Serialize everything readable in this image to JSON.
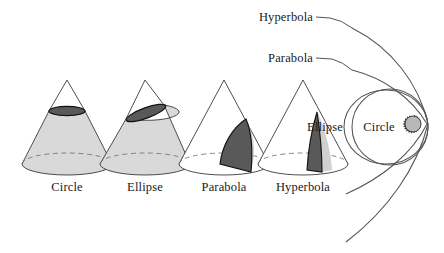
{
  "figure": {
    "width": 444,
    "height": 253,
    "background_color": "#ffffff"
  },
  "colors": {
    "stroke": "#3a3a3a",
    "cone_fill": "#d9d9d9",
    "section_dark": "#595959",
    "section_mid": "#6e6e6e",
    "sun_fill": "#b8b8b8",
    "sun_outline": "#262626",
    "text": "#1a1a1a",
    "dashed_stroke": "#6b6b6b"
  },
  "cones": [
    {
      "id": "cone-circle",
      "label": "Circle",
      "label_x": 67,
      "label_y": 188,
      "apex_x": 67,
      "apex_y": 80,
      "base_cx": 67,
      "base_cy": 164,
      "base_rx": 45,
      "base_ry": 11,
      "body_filled": true,
      "section_type": "horizontal-ellipse",
      "section_cx": 67,
      "section_cy": 111,
      "section_rx": 18,
      "section_ry": 4.6,
      "section_rotation": 0
    },
    {
      "id": "cone-ellipse",
      "label": "Ellipse",
      "label_x": 145,
      "label_y": 188,
      "apex_x": 145,
      "apex_y": 80,
      "base_cx": 145,
      "base_cy": 164,
      "base_rx": 45,
      "base_ry": 11,
      "body_filled": true,
      "section_type": "tilted-ellipse",
      "section_cx": 146,
      "section_cy": 113,
      "section_rx": 21,
      "section_ry": 5.2,
      "section_rotation": -20
    },
    {
      "id": "cone-parabola",
      "label": "Parabola",
      "label_x": 224,
      "label_y": 188,
      "apex_x": 224,
      "apex_y": 80,
      "base_cx": 224,
      "base_cy": 164,
      "base_rx": 45,
      "base_ry": 11,
      "body_filled": false,
      "section_type": "parabolic-slice"
    },
    {
      "id": "cone-hyperbola",
      "label": "Hyperbola",
      "label_x": 303,
      "label_y": 188,
      "apex_x": 303,
      "apex_y": 80,
      "base_cx": 303,
      "base_cy": 164,
      "base_rx": 45,
      "base_ry": 11,
      "body_filled": false,
      "section_type": "hyperbolic-slice"
    }
  ],
  "orbit_diagram": {
    "focus_x": 428,
    "focus_y": 126,
    "sun": {
      "cx": 413,
      "cy": 127,
      "r": 9,
      "spikes": 30
    },
    "labels": [
      {
        "id": "orbit-label-ellipse",
        "text": "Ellipse",
        "x": 325,
        "y": 127,
        "anchor": "middle"
      },
      {
        "id": "orbit-label-circle",
        "text": "Circle",
        "x": 379,
        "y": 127,
        "anchor": "middle"
      },
      {
        "id": "callout-label-parabola",
        "text": "Parabola",
        "x": 313,
        "y": 58,
        "anchor": "end"
      },
      {
        "id": "callout-label-hyperbola",
        "text": "Hyperbola",
        "x": 313,
        "y": 17,
        "anchor": "end"
      }
    ],
    "paths": [
      {
        "id": "orbit-path-circle",
        "type": "circle",
        "label": "Circle"
      },
      {
        "id": "orbit-path-ellipse",
        "type": "ellipse",
        "label": "Ellipse"
      },
      {
        "id": "orbit-path-parabola",
        "type": "parabola",
        "label": "Parabola"
      },
      {
        "id": "orbit-path-hyperbola",
        "type": "hyperbola",
        "label": "Hyperbola"
      }
    ],
    "leader_lines": [
      {
        "id": "leader-parabola",
        "from_x": 316,
        "from_y": 58,
        "to_x": 352,
        "to_y": 70
      },
      {
        "id": "leader-hyperbola",
        "from_x": 316,
        "from_y": 17,
        "to_x": 352,
        "to_y": 28
      }
    ]
  }
}
